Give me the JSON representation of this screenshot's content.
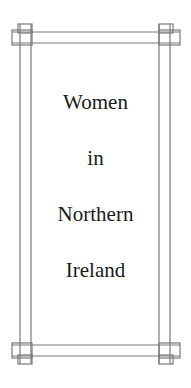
{
  "document": {
    "title_lines": [
      "Women",
      "in",
      "Northern",
      "Ireland"
    ],
    "border_style": "double-rule interlaced corner frame",
    "colors": {
      "background": "#ffffff",
      "text": "#1a1a1a",
      "border": "#7a7a7a"
    }
  }
}
